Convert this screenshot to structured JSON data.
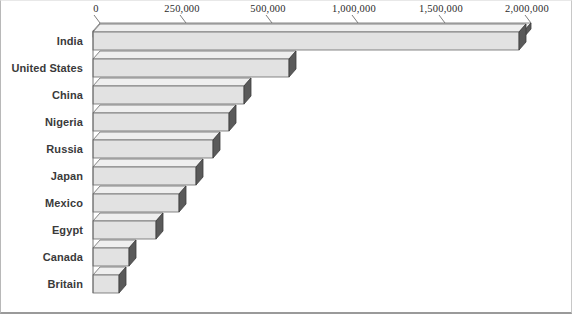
{
  "chart_data": {
    "type": "bar",
    "orientation": "horizontal",
    "style": "3d-isometric",
    "title": "",
    "subtitle": "",
    "xlabel": "",
    "ylabel": "",
    "grid": false,
    "legend": null,
    "axis_note": "tick labels are evenly spaced on the drawn axis although the numeric steps are uneven (250,000 then 500,000 steps)",
    "xticklabels": [
      "0",
      "250,000",
      "500,000",
      "1,000,000",
      "1,500,000",
      "2,000,000"
    ],
    "xtickvalues": [
      0,
      250000,
      500000,
      1000000,
      1500000,
      2000000
    ],
    "xtick_pixel_positions": [
      92,
      178,
      264,
      350,
      437,
      523
    ],
    "categories": [
      "India",
      "United States",
      "China",
      "Nigeria",
      "Russia",
      "Japan",
      "Mexico",
      "Egypt",
      "Canada",
      "Britain"
    ],
    "values": [
      1960000,
      580000,
      440000,
      395000,
      350000,
      300000,
      255000,
      185000,
      105000,
      75000
    ],
    "bar_end_pixels": [
      518,
      288,
      243,
      228,
      212,
      195,
      178,
      155,
      128,
      118
    ],
    "xlim": [
      0,
      2000000
    ]
  },
  "colors": {
    "background": "#ffffff",
    "bar_front": "#e2e2e2",
    "bar_top": "#efefef",
    "bar_cap": "#5a5a5a",
    "bar_outline": "#6a6a6a",
    "axis_line": "#6a6a6a",
    "label_text": "#3a3a3a",
    "tick_text": "#2b2b2b",
    "frame_border": "#b8b8b8"
  },
  "geometry": {
    "baseline_x": 92,
    "axis_top_y": 30,
    "first_bar_top": 31,
    "bar_height": 18,
    "bar_pitch": 27,
    "depth_x": 7,
    "depth_y": -8
  }
}
